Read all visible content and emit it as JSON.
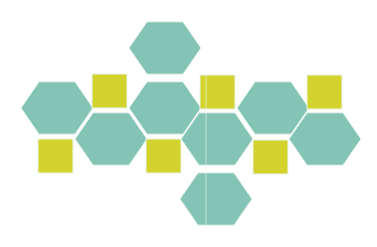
{
  "diagram": {
    "title": "",
    "colors": {
      "hexagon": "#84c4b4",
      "square": "#d4d22c",
      "edge": "#e8f6ee",
      "background": "#ffffff"
    },
    "hexagon_radius": 36,
    "hexagons": [
      {
        "id": "hex-top",
        "cx": 165,
        "cy": 48
      },
      {
        "id": "hex-row1-left",
        "cx": 57,
        "cy": 108
      },
      {
        "id": "hex-row1-center",
        "cx": 165,
        "cy": 108
      },
      {
        "id": "hex-row1-right",
        "cx": 273,
        "cy": 108
      },
      {
        "id": "hex-row2-left",
        "cx": 111,
        "cy": 139
      },
      {
        "id": "hex-row2-center",
        "cx": 217,
        "cy": 139
      },
      {
        "id": "hex-row2-right",
        "cx": 325,
        "cy": 139
      },
      {
        "id": "hex-bottom",
        "cx": 216,
        "cy": 199
      }
    ],
    "squares": [
      {
        "id": "square-upper-1",
        "x": 92,
        "y": 74,
        "w": 35,
        "h": 34
      },
      {
        "id": "square-upper-2",
        "x": 200,
        "y": 75,
        "w": 35,
        "h": 34
      },
      {
        "id": "square-upper-3",
        "x": 307,
        "y": 75,
        "w": 35,
        "h": 34
      },
      {
        "id": "square-lower-1",
        "x": 38,
        "y": 139,
        "w": 35,
        "h": 34
      },
      {
        "id": "square-lower-2",
        "x": 146,
        "y": 139,
        "w": 35,
        "h": 34
      },
      {
        "id": "square-lower-3",
        "x": 253,
        "y": 140,
        "w": 35,
        "h": 34
      }
    ],
    "fold_lines": [
      {
        "x1": 206,
        "y1": 75,
        "x2": 206,
        "y2": 229
      }
    ]
  }
}
